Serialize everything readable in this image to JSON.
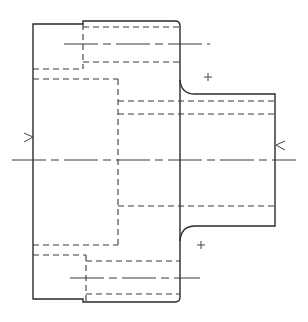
{
  "drawing": {
    "title": "Flanged sleeve section view",
    "type": "technical-drawing",
    "colors": {
      "line": "#2a2a2a",
      "background": "#ffffff"
    },
    "outline": {
      "left_x": 33,
      "step_x": 83,
      "flange_right_x": 180,
      "hub_right_x": 275,
      "top_left_y": 24,
      "top_step_y": 21,
      "bottom_left_y": 299,
      "bottom_step_y": 302,
      "hub_top_y": 94,
      "hub_bottom_y": 226
    },
    "centerline_y": 160,
    "section_markers": [
      {
        "symbol": ">",
        "name": "left-section-arrow",
        "x": 28,
        "y": 137
      },
      {
        "symbol": "<",
        "name": "right-section-arrow",
        "x": 281,
        "y": 145
      }
    ],
    "plus_marks": [
      {
        "name": "upper-fillet-center",
        "x": 208,
        "y": 77
      },
      {
        "name": "lower-fillet-center",
        "x": 201,
        "y": 245
      }
    ]
  }
}
